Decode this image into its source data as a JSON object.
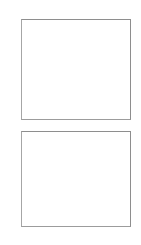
{
  "page": {
    "title": "",
    "background_color": "#ffffff",
    "width": 141,
    "height": 245
  },
  "panels": [
    {
      "id": "panel-top",
      "label": "",
      "content": "",
      "border_color": "#9a9a9a",
      "fill_color": "#ffffff",
      "x": 21,
      "y": 19,
      "width": 110,
      "height": 101
    },
    {
      "id": "panel-bottom",
      "label": "",
      "content": "",
      "border_color": "#9a9a9a",
      "fill_color": "#ffffff",
      "x": 21,
      "y": 131,
      "width": 110,
      "height": 96
    }
  ]
}
